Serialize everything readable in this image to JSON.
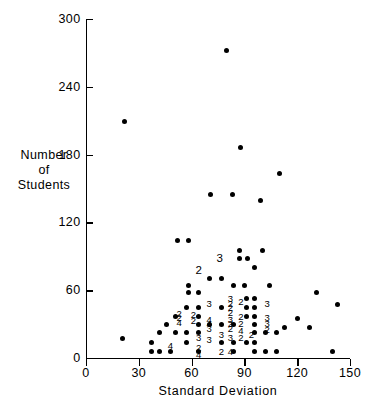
{
  "chart_data": {
    "type": "scatter",
    "title": "",
    "xlabel": "Standard Deviation",
    "ylabel": "Number of Students",
    "ylabel_lines": [
      "Number",
      "of",
      "Students"
    ],
    "xlim": [
      0,
      150
    ],
    "ylim": [
      0,
      300
    ],
    "xticks": [
      0,
      30,
      60,
      90,
      120,
      150
    ],
    "yticks": [
      0,
      60,
      120,
      180,
      240,
      300
    ],
    "xtick_labels": [
      "0",
      "30",
      "60",
      "90",
      "120",
      "150"
    ],
    "ytick_labels": [
      "0",
      "60",
      "120",
      "180",
      "240",
      "300"
    ],
    "grid": false,
    "legend": false,
    "marker": "filled-circle",
    "marker_color": "#000000",
    "points": [
      {
        "x": 80,
        "y": 272
      },
      {
        "x": 22,
        "y": 209
      },
      {
        "x": 88,
        "y": 186
      },
      {
        "x": 110,
        "y": 163
      },
      {
        "x": 71,
        "y": 145
      },
      {
        "x": 83,
        "y": 145
      },
      {
        "x": 99,
        "y": 139
      },
      {
        "x": 52,
        "y": 104
      },
      {
        "x": 58,
        "y": 104
      },
      {
        "x": 87,
        "y": 95
      },
      {
        "x": 100,
        "y": 95
      },
      {
        "x": 87,
        "y": 88
      },
      {
        "x": 92,
        "y": 88
      },
      {
        "x": 96,
        "y": 80
      },
      {
        "x": 70,
        "y": 70
      },
      {
        "x": 77,
        "y": 70
      },
      {
        "x": 58,
        "y": 64
      },
      {
        "x": 84,
        "y": 64
      },
      {
        "x": 90,
        "y": 64
      },
      {
        "x": 104,
        "y": 64
      },
      {
        "x": 58,
        "y": 58
      },
      {
        "x": 64,
        "y": 58
      },
      {
        "x": 131,
        "y": 58
      },
      {
        "x": 91,
        "y": 53
      },
      {
        "x": 96,
        "y": 53
      },
      {
        "x": 143,
        "y": 47
      },
      {
        "x": 57,
        "y": 45
      },
      {
        "x": 64,
        "y": 45
      },
      {
        "x": 77,
        "y": 45
      },
      {
        "x": 91,
        "y": 45
      },
      {
        "x": 96,
        "y": 45
      },
      {
        "x": 51,
        "y": 37
      },
      {
        "x": 64,
        "y": 37
      },
      {
        "x": 91,
        "y": 37
      },
      {
        "x": 96,
        "y": 37
      },
      {
        "x": 120,
        "y": 35
      },
      {
        "x": 46,
        "y": 30
      },
      {
        "x": 64,
        "y": 30
      },
      {
        "x": 70,
        "y": 30
      },
      {
        "x": 77,
        "y": 30
      },
      {
        "x": 84,
        "y": 30
      },
      {
        "x": 96,
        "y": 30
      },
      {
        "x": 113,
        "y": 27
      },
      {
        "x": 127,
        "y": 27
      },
      {
        "x": 42,
        "y": 23
      },
      {
        "x": 51,
        "y": 23
      },
      {
        "x": 57,
        "y": 23
      },
      {
        "x": 64,
        "y": 23
      },
      {
        "x": 96,
        "y": 23
      },
      {
        "x": 102,
        "y": 23
      },
      {
        "x": 108,
        "y": 23
      },
      {
        "x": 21,
        "y": 17
      },
      {
        "x": 37,
        "y": 14
      },
      {
        "x": 57,
        "y": 14
      },
      {
        "x": 77,
        "y": 14
      },
      {
        "x": 84,
        "y": 14
      },
      {
        "x": 91,
        "y": 14
      },
      {
        "x": 96,
        "y": 14
      },
      {
        "x": 37,
        "y": 6
      },
      {
        "x": 42,
        "y": 6
      },
      {
        "x": 48,
        "y": 6
      },
      {
        "x": 64,
        "y": 6
      },
      {
        "x": 84,
        "y": 6
      },
      {
        "x": 96,
        "y": 6
      },
      {
        "x": 102,
        "y": 6
      },
      {
        "x": 108,
        "y": 6
      },
      {
        "x": 140,
        "y": 6
      }
    ],
    "count_labels": [
      {
        "x": 76,
        "y": 88,
        "count": "3",
        "size": "big"
      },
      {
        "x": 64,
        "y": 77,
        "count": "2",
        "size": "big"
      },
      {
        "x": 70,
        "y": 48,
        "count": "3"
      },
      {
        "x": 82,
        "y": 52,
        "count": "3"
      },
      {
        "x": 82,
        "y": 48,
        "count": "2"
      },
      {
        "x": 82,
        "y": 44,
        "count": "2"
      },
      {
        "x": 82,
        "y": 40,
        "count": "2"
      },
      {
        "x": 88,
        "y": 50,
        "count": "2"
      },
      {
        "x": 103,
        "y": 48,
        "count": "3"
      },
      {
        "x": 53,
        "y": 39,
        "count": "2"
      },
      {
        "x": 53,
        "y": 35,
        "count": "2"
      },
      {
        "x": 53,
        "y": 31,
        "count": "4"
      },
      {
        "x": 61,
        "y": 38,
        "count": "2"
      },
      {
        "x": 61,
        "y": 33,
        "count": "2"
      },
      {
        "x": 70,
        "y": 34,
        "count": "4"
      },
      {
        "x": 70,
        "y": 30,
        "count": "4"
      },
      {
        "x": 70,
        "y": 26,
        "count": "3"
      },
      {
        "x": 82,
        "y": 34,
        "count": "3"
      },
      {
        "x": 82,
        "y": 30,
        "count": "2"
      },
      {
        "x": 82,
        "y": 26,
        "count": "2"
      },
      {
        "x": 88,
        "y": 36,
        "count": "2"
      },
      {
        "x": 88,
        "y": 30,
        "count": "2"
      },
      {
        "x": 88,
        "y": 24,
        "count": "4"
      },
      {
        "x": 103,
        "y": 35,
        "count": "3"
      },
      {
        "x": 103,
        "y": 30,
        "count": "3"
      },
      {
        "x": 103,
        "y": 25,
        "count": "2"
      },
      {
        "x": 64,
        "y": 18,
        "count": "3"
      },
      {
        "x": 70,
        "y": 16,
        "count": "3"
      },
      {
        "x": 77,
        "y": 20,
        "count": "3"
      },
      {
        "x": 82,
        "y": 18,
        "count": "3"
      },
      {
        "x": 88,
        "y": 18,
        "count": "2"
      },
      {
        "x": 94,
        "y": 20,
        "count": "2"
      },
      {
        "x": 48,
        "y": 11,
        "count": "4"
      },
      {
        "x": 64,
        "y": 9,
        "count": "2"
      },
      {
        "x": 64,
        "y": 3,
        "count": "4"
      },
      {
        "x": 77,
        "y": 5,
        "count": "2"
      },
      {
        "x": 82,
        "y": 5,
        "count": "4"
      }
    ]
  }
}
